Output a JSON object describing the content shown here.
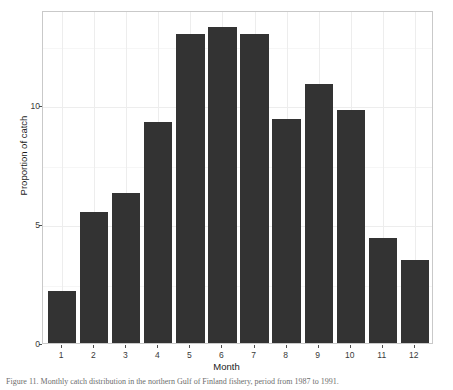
{
  "chart_data": {
    "type": "bar",
    "title": "",
    "xlabel": "Month",
    "ylabel": "Proportion of catch",
    "categories": [
      "1",
      "2",
      "3",
      "4",
      "5",
      "6",
      "7",
      "8",
      "9",
      "10",
      "11",
      "12"
    ],
    "values": [
      2.2,
      5.5,
      6.3,
      9.3,
      13.0,
      13.3,
      13.0,
      9.4,
      10.9,
      9.8,
      4.4,
      3.5
    ],
    "ylim": [
      0,
      14
    ],
    "xlim": [
      0.4,
      12.6
    ],
    "yticks": [
      0,
      5,
      10
    ],
    "ytick_labels": [
      "0",
      "5",
      "10"
    ],
    "xticks": [
      1,
      2,
      3,
      4,
      5,
      6,
      7,
      8,
      9,
      10,
      11,
      12
    ],
    "grid": true,
    "legend": "none",
    "bar_color": "#333333",
    "panel_background": "#ffffff",
    "grid_color": "#ededed"
  },
  "caption": {
    "text": "Figure 11. Monthly catch distribution in the northern Gulf of Finland fishery, period from 1987 to 1991."
  }
}
